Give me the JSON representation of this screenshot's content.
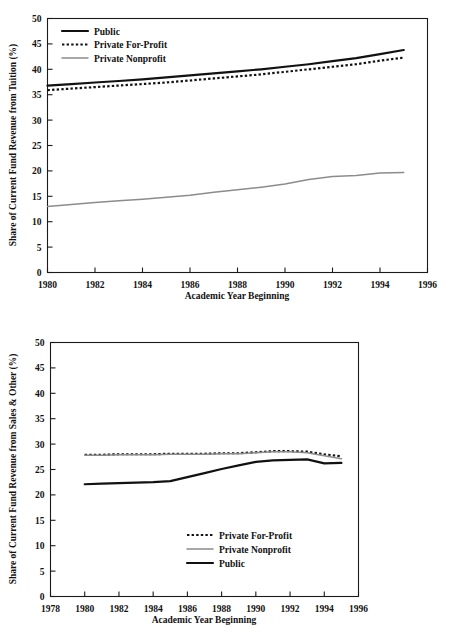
{
  "page": {
    "background_color": "#ffffff",
    "series_colors": {
      "public": "#111111",
      "private_for_profit": "#111111",
      "private_nonprofit": "#8c8c8c"
    }
  },
  "chart_data": [
    {
      "id": "tuition",
      "type": "line",
      "title": "",
      "xlabel": "Academic Year Beginning",
      "ylabel": "Share of Current Fund Revenue from Tuition (%)",
      "xlim": [
        1980,
        1996
      ],
      "ylim": [
        0,
        50
      ],
      "xticks": [
        1980,
        1982,
        1984,
        1986,
        1988,
        1990,
        1992,
        1994,
        1996
      ],
      "xticklabels": [
        "1980",
        "1982",
        "1984",
        "1986",
        "1988",
        "1990",
        "1992",
        "1994",
        "1996"
      ],
      "yticks": [
        0,
        5,
        10,
        15,
        20,
        25,
        30,
        35,
        40,
        45,
        50
      ],
      "yticklabels": [
        "0",
        "5",
        "10",
        "15",
        "20",
        "25",
        "30",
        "35",
        "40",
        "45",
        "50"
      ],
      "grid": false,
      "legend_position": "upper-left",
      "x": [
        1980,
        1981,
        1982,
        1983,
        1984,
        1985,
        1986,
        1987,
        1988,
        1989,
        1990,
        1991,
        1992,
        1993,
        1994,
        1995
      ],
      "series": [
        {
          "name": "Public",
          "style": "solid",
          "color": "#111111",
          "values": [
            36.8,
            37.1,
            37.4,
            37.7,
            38.0,
            38.4,
            38.8,
            39.2,
            39.6,
            40.0,
            40.5,
            41.0,
            41.6,
            42.2,
            43.0,
            43.8
          ]
        },
        {
          "name": "Private For-Profit",
          "style": "dotted",
          "color": "#111111",
          "values": [
            35.9,
            36.2,
            36.5,
            36.8,
            37.1,
            37.4,
            37.8,
            38.2,
            38.6,
            39.0,
            39.5,
            40.0,
            40.5,
            41.0,
            41.7,
            42.3
          ]
        },
        {
          "name": "Private Nonprofit",
          "style": "solid-gray",
          "color": "#8c8c8c",
          "values": [
            13.0,
            13.4,
            13.8,
            14.1,
            14.4,
            14.8,
            15.2,
            15.8,
            16.3,
            16.8,
            17.4,
            18.3,
            18.9,
            19.1,
            19.6,
            19.7
          ]
        }
      ],
      "legend": [
        {
          "label": "Public",
          "style": "solid",
          "color": "#111111"
        },
        {
          "label": "Private For-Profit",
          "style": "dotted",
          "color": "#111111"
        },
        {
          "label": "Private Nonprofit",
          "style": "solid-gray",
          "color": "#8c8c8c"
        }
      ]
    },
    {
      "id": "sales",
      "type": "line",
      "title": "",
      "xlabel": "Academic Year Beginning",
      "ylabel": "Share of Current Fund Revenue from Sales & Other (%)",
      "xlim": [
        1978,
        1996
      ],
      "ylim": [
        0,
        50
      ],
      "xticks": [
        1978,
        1980,
        1982,
        1984,
        1986,
        1988,
        1990,
        1992,
        1994,
        1996
      ],
      "xticklabels": [
        "1978",
        "1980",
        "1982",
        "1984",
        "1986",
        "1988",
        "1990",
        "1992",
        "1994",
        "1996"
      ],
      "yticks": [
        0,
        5,
        10,
        15,
        20,
        25,
        30,
        35,
        40,
        45,
        50
      ],
      "yticklabels": [
        "0",
        "5",
        "10",
        "15",
        "20",
        "25",
        "30",
        "35",
        "40",
        "45",
        "50"
      ],
      "grid": false,
      "legend_position": "lower-right",
      "x": [
        1980,
        1981,
        1982,
        1983,
        1984,
        1985,
        1986,
        1987,
        1988,
        1989,
        1990,
        1991,
        1992,
        1993,
        1994,
        1995
      ],
      "series": [
        {
          "name": "Private For-Profit",
          "style": "dotted",
          "color": "#111111",
          "values": [
            27.9,
            27.9,
            28.0,
            28.0,
            28.0,
            28.1,
            28.1,
            28.1,
            28.2,
            28.2,
            28.4,
            28.6,
            28.6,
            28.5,
            28.0,
            27.6
          ]
        },
        {
          "name": "Private Nonprofit",
          "style": "solid-gray",
          "color": "#8c8c8c",
          "values": [
            27.8,
            27.8,
            27.9,
            27.9,
            27.9,
            28.0,
            28.0,
            28.0,
            28.1,
            28.1,
            28.3,
            28.5,
            28.5,
            28.3,
            27.7,
            27.1
          ]
        },
        {
          "name": "Public",
          "style": "solid",
          "color": "#111111",
          "values": [
            22.1,
            22.2,
            22.3,
            22.4,
            22.5,
            22.7,
            23.5,
            24.3,
            25.1,
            25.8,
            26.5,
            26.8,
            26.9,
            27.0,
            26.2,
            26.3
          ]
        }
      ],
      "legend": [
        {
          "label": "Private For-Profit",
          "style": "dotted",
          "color": "#111111"
        },
        {
          "label": "Private Nonprofit",
          "style": "solid-gray",
          "color": "#8c8c8c"
        },
        {
          "label": "Public",
          "style": "solid",
          "color": "#111111"
        }
      ]
    }
  ]
}
